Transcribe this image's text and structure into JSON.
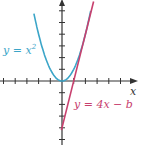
{
  "chart_data": {
    "type": "line",
    "title": "",
    "xlabel": "x",
    "ylabel": "",
    "xlim": [
      -5,
      6.3
    ],
    "ylim": [
      -5.3,
      6.9
    ],
    "grid": false,
    "tick_step": 1,
    "series": [
      {
        "name": "y = x^2",
        "label": "y = x",
        "label_sup": "2",
        "color": "#3ba5c8",
        "expr": "x^2",
        "x": [
          -2.3,
          -2,
          -1.5,
          -1,
          -0.5,
          0,
          0.5,
          1,
          1.5,
          2,
          2.5
        ],
        "y": [
          5.29,
          4,
          2.25,
          1,
          0.25,
          0,
          0.25,
          1,
          2.25,
          4,
          6.25
        ]
      },
      {
        "name": "y = 4x - b",
        "label": "y = 4x − b",
        "color": "#c8406e",
        "expr": "4x - 4",
        "x": [
          -0.05,
          2.7
        ],
        "y": [
          -4.2,
          6.8
        ]
      }
    ],
    "annotations": [
      "y = x²",
      "y = 4x − b",
      "x"
    ]
  }
}
